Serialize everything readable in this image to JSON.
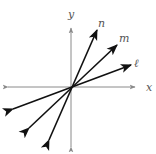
{
  "diagram": {
    "type": "coordinate-plane-lines",
    "origin": [
      71,
      87
    ],
    "axes": {
      "x": {
        "label": "x",
        "from": [
          8,
          87
        ],
        "to": [
          135,
          87
        ],
        "label_pos": [
          146,
          91
        ]
      },
      "y": {
        "label": "y",
        "from": [
          71,
          147
        ],
        "to": [
          71,
          28
        ],
        "label_pos": [
          68,
          18
        ]
      }
    },
    "lines": [
      {
        "name": "n",
        "label": "n",
        "tip": [
          97,
          30
        ],
        "tail": [
          49,
          140
        ],
        "label_pos": [
          98,
          27
        ]
      },
      {
        "name": "m",
        "label": "m",
        "tip": [
          117,
          45
        ],
        "tail": [
          29,
          128
        ],
        "label_pos": [
          119,
          42
        ]
      },
      {
        "name": "l",
        "label": "ℓ",
        "tip": [
          131,
          65
        ],
        "tail": [
          13,
          109
        ],
        "label_pos": [
          134,
          67
        ]
      }
    ],
    "colors": {
      "axis": "#8a8a8a",
      "line": "#111111",
      "label": "#555555"
    }
  }
}
